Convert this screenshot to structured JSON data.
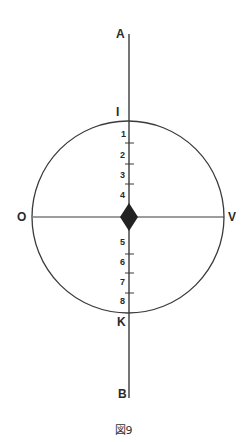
{
  "diagram": {
    "caption": "図9",
    "axis_labels": {
      "top": "A",
      "bottom": "B",
      "left": "O",
      "right": "V",
      "circle_top": "I",
      "circle_bottom": "K"
    },
    "scale_upper": [
      "1",
      "2",
      "3",
      "4"
    ],
    "scale_lower": [
      "5",
      "6",
      "7",
      "8"
    ],
    "colors": {
      "line": "#3a3a3a",
      "diamond": "#222222",
      "background": "#ffffff"
    }
  }
}
